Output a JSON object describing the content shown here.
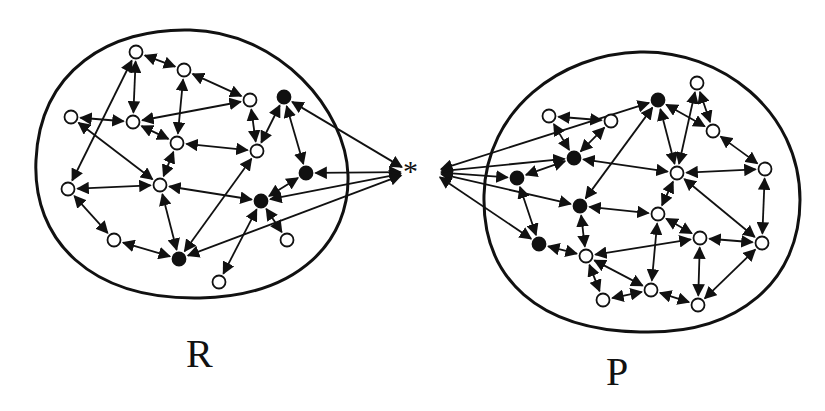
{
  "labels": {
    "left": "R",
    "right": "P",
    "center": "*"
  },
  "colors": {
    "stroke": "#111111",
    "fill_open": "#ffffff",
    "fill_solid": "#111111",
    "background": "#ffffff"
  },
  "center_point": [
    414,
    172
  ],
  "blobs": {
    "R": "M 190 30 C 110 28 40 70 36 160 C 32 240 90 300 200 298 C 300 296 350 240 348 175 C 346 110 280 32 190 30 Z",
    "P": "M 640 52 C 720 50 800 110 800 200 C 800 280 740 335 640 332 C 540 330 482 280 484 195 C 486 110 560 54 640 52 Z"
  },
  "nodes": {
    "R": [
      {
        "id": "r1",
        "x": 136,
        "y": 52,
        "solid": false
      },
      {
        "id": "r2",
        "x": 184,
        "y": 70,
        "solid": false
      },
      {
        "id": "r3",
        "x": 71,
        "y": 117,
        "solid": false
      },
      {
        "id": "r4",
        "x": 133,
        "y": 122,
        "solid": false
      },
      {
        "id": "r5",
        "x": 250,
        "y": 100,
        "solid": false
      },
      {
        "id": "r6",
        "x": 284,
        "y": 97,
        "solid": true
      },
      {
        "id": "r7",
        "x": 177,
        "y": 143,
        "solid": false
      },
      {
        "id": "r8",
        "x": 257,
        "y": 151,
        "solid": false
      },
      {
        "id": "r9",
        "x": 306,
        "y": 173,
        "solid": true
      },
      {
        "id": "r10",
        "x": 68,
        "y": 189,
        "solid": false
      },
      {
        "id": "r11",
        "x": 160,
        "y": 185,
        "solid": false
      },
      {
        "id": "r12",
        "x": 261,
        "y": 201,
        "solid": true
      },
      {
        "id": "r13",
        "x": 114,
        "y": 240,
        "solid": false
      },
      {
        "id": "r14",
        "x": 287,
        "y": 240,
        "solid": false
      },
      {
        "id": "r15",
        "x": 179,
        "y": 259,
        "solid": true
      },
      {
        "id": "r16",
        "x": 219,
        "y": 282,
        "solid": false
      }
    ],
    "P": [
      {
        "id": "p1",
        "x": 697,
        "y": 83,
        "solid": false
      },
      {
        "id": "p2",
        "x": 658,
        "y": 100,
        "solid": true
      },
      {
        "id": "p3",
        "x": 549,
        "y": 116,
        "solid": false
      },
      {
        "id": "p4",
        "x": 611,
        "y": 121,
        "solid": false
      },
      {
        "id": "p5",
        "x": 713,
        "y": 131,
        "solid": false
      },
      {
        "id": "p6",
        "x": 574,
        "y": 158,
        "solid": true
      },
      {
        "id": "p7",
        "x": 517,
        "y": 178,
        "solid": true
      },
      {
        "id": "p8",
        "x": 677,
        "y": 173,
        "solid": false
      },
      {
        "id": "p9",
        "x": 765,
        "y": 169,
        "solid": false
      },
      {
        "id": "p10",
        "x": 580,
        "y": 206,
        "solid": true
      },
      {
        "id": "p11",
        "x": 658,
        "y": 214,
        "solid": false
      },
      {
        "id": "p12",
        "x": 539,
        "y": 244,
        "solid": true
      },
      {
        "id": "p13",
        "x": 700,
        "y": 238,
        "solid": false
      },
      {
        "id": "p14",
        "x": 762,
        "y": 243,
        "solid": false
      },
      {
        "id": "p15",
        "x": 586,
        "y": 256,
        "solid": false
      },
      {
        "id": "p16",
        "x": 651,
        "y": 290,
        "solid": false
      },
      {
        "id": "p17",
        "x": 603,
        "y": 300,
        "solid": false
      },
      {
        "id": "p18",
        "x": 698,
        "y": 305,
        "solid": false
      }
    ]
  },
  "edges": [
    [
      "r1",
      "r2"
    ],
    [
      "r1",
      "r4"
    ],
    [
      "r1",
      "r10"
    ],
    [
      "r2",
      "r7"
    ],
    [
      "r2",
      "r5"
    ],
    [
      "r3",
      "r4"
    ],
    [
      "r3",
      "r11"
    ],
    [
      "r4",
      "r5"
    ],
    [
      "r4",
      "r7"
    ],
    [
      "r5",
      "r8"
    ],
    [
      "r8",
      "r6"
    ],
    [
      "r6",
      "r9"
    ],
    [
      "r7",
      "r8"
    ],
    [
      "r7",
      "r11"
    ],
    [
      "r10",
      "r11"
    ],
    [
      "r10",
      "r13"
    ],
    [
      "r11",
      "r12"
    ],
    [
      "r11",
      "r15"
    ],
    [
      "r13",
      "r15"
    ],
    [
      "r8",
      "r15"
    ],
    [
      "r9",
      "r12"
    ],
    [
      "r12",
      "r16"
    ],
    [
      "r14",
      "r12"
    ],
    [
      "p1",
      "p8"
    ],
    [
      "p1",
      "p5"
    ],
    [
      "p5",
      "p2"
    ],
    [
      "p2",
      "p8"
    ],
    [
      "p2",
      "p10"
    ],
    [
      "p3",
      "p4"
    ],
    [
      "p3",
      "p6"
    ],
    [
      "p4",
      "p6"
    ],
    [
      "p6",
      "p7"
    ],
    [
      "p6",
      "p8"
    ],
    [
      "p7",
      "p12"
    ],
    [
      "p8",
      "p9"
    ],
    [
      "p5",
      "p9"
    ],
    [
      "p8",
      "p11"
    ],
    [
      "p8",
      "p14"
    ],
    [
      "p9",
      "p14"
    ],
    [
      "p10",
      "p11"
    ],
    [
      "p10",
      "p15"
    ],
    [
      "p12",
      "p15"
    ],
    [
      "p11",
      "p13"
    ],
    [
      "p11",
      "p16"
    ],
    [
      "p13",
      "p15"
    ],
    [
      "p13",
      "p14"
    ],
    [
      "p13",
      "p18"
    ],
    [
      "p15",
      "p17"
    ],
    [
      "p15",
      "p16"
    ],
    [
      "p16",
      "p17"
    ],
    [
      "p16",
      "p18"
    ],
    [
      "p14",
      "p18"
    ]
  ],
  "center_edges": {
    "R": [
      "r6",
      "r9",
      "r12",
      "r15"
    ],
    "P": [
      "p2",
      "p6",
      "p7",
      "p10",
      "p12"
    ]
  }
}
